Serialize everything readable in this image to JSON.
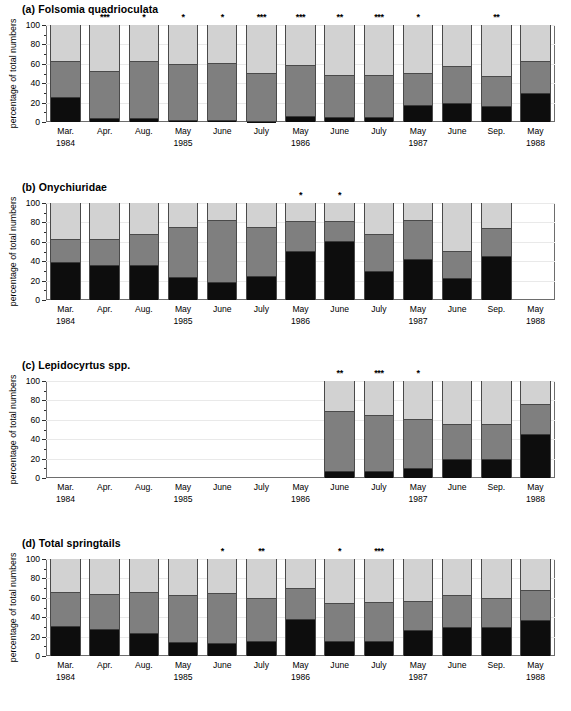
{
  "figure": {
    "yaxis_title": "percentage of total numbers",
    "y_ticks": [
      0,
      20,
      40,
      60,
      80,
      100
    ],
    "y_minor_ticks": [
      10,
      30,
      50,
      70,
      90
    ],
    "ylim": [
      0,
      100
    ],
    "x_categories": [
      {
        "month": "Mar.",
        "year": "1984"
      },
      {
        "month": "Apr.",
        "year": ""
      },
      {
        "month": "Aug.",
        "year": ""
      },
      {
        "month": "May",
        "year": "1985"
      },
      {
        "month": "June",
        "year": ""
      },
      {
        "month": "July",
        "year": ""
      },
      {
        "month": "May",
        "year": "1986"
      },
      {
        "month": "June",
        "year": ""
      },
      {
        "month": "July",
        "year": ""
      },
      {
        "month": "May",
        "year": "1987"
      },
      {
        "month": "June",
        "year": ""
      },
      {
        "month": "Sep.",
        "year": ""
      },
      {
        "month": "May",
        "year": "1988"
      }
    ],
    "colors": {
      "bottom": "#0d0d0d",
      "middle": "#7f7f7f",
      "top": "#d2d2d2",
      "frame": "#6d6d6d",
      "grid": "#e9e9e9"
    }
  },
  "chart_data": [
    {
      "type": "bar",
      "panel": "a",
      "title": "(a) Folsomia quadrioculata",
      "xlabel": "",
      "ylabel": "percentage of total numbers",
      "ylim": [
        0,
        100
      ],
      "grid": true,
      "stacked": true,
      "legend": "none",
      "categories": [
        "Mar. 1984",
        "Apr.",
        "Aug.",
        "May 1985",
        "June",
        "July",
        "May 1986",
        "June",
        "July",
        "May 1987",
        "June",
        "Sep.",
        "May 1988"
      ],
      "series": [
        {
          "name": "bottom",
          "values": [
            25,
            3.5,
            3.5,
            1,
            1,
            0.5,
            5,
            4.5,
            4,
            16,
            19,
            15,
            29
          ]
        },
        {
          "name": "middle",
          "values": [
            37,
            48.5,
            58,
            57.5,
            59,
            49,
            52.5,
            42.5,
            43.5,
            33,
            37.5,
            31.5,
            33
          ]
        },
        {
          "name": "top",
          "values": [
            38,
            48,
            38.5,
            41.5,
            40,
            50.5,
            42.5,
            53,
            52.5,
            51,
            43.5,
            53.5,
            38
          ]
        }
      ],
      "significance": [
        "",
        "***",
        "*",
        "*",
        "*",
        "***",
        "***",
        "**",
        "***",
        "*",
        "",
        "**",
        ""
      ]
    },
    {
      "type": "bar",
      "panel": "b",
      "title": "(b) Onychiuridae",
      "xlabel": "",
      "ylabel": "percentage of total numbers",
      "ylim": [
        0,
        100
      ],
      "grid": true,
      "stacked": true,
      "legend": "none",
      "categories": [
        "Mar. 1984",
        "Apr.",
        "Aug.",
        "May 1985",
        "June",
        "July",
        "May 1986",
        "June",
        "July",
        "May 1987",
        "June",
        "Sep.",
        "May 1988"
      ],
      "series": [
        {
          "name": "bottom",
          "values": [
            38,
            35,
            35,
            22.5,
            17.5,
            24,
            50,
            59.5,
            29,
            41,
            21.5,
            44,
            0
          ]
        },
        {
          "name": "middle",
          "values": [
            24,
            27,
            32.5,
            52,
            64,
            50,
            30.5,
            20.5,
            38.5,
            40.5,
            27.5,
            29.5,
            0
          ]
        },
        {
          "name": "top",
          "values": [
            38,
            38,
            32.5,
            25.5,
            18.5,
            26,
            19.5,
            20,
            32.5,
            18.5,
            51,
            26.5,
            0
          ]
        }
      ],
      "significance": [
        "",
        "",
        "",
        "",
        "",
        "",
        "*",
        "*",
        "",
        "",
        "",
        "",
        ""
      ]
    },
    {
      "type": "bar",
      "panel": "c",
      "title": "(c) Lepidocyrtus spp.",
      "xlabel": "",
      "ylabel": "percentage of total numbers",
      "ylim": [
        0,
        100
      ],
      "grid": true,
      "stacked": true,
      "legend": "none",
      "categories": [
        "Mar. 1984",
        "Apr.",
        "Aug.",
        "May 1985",
        "June",
        "July",
        "May 1986",
        "June",
        "July",
        "May 1987",
        "June",
        "Sep.",
        "May 1988"
      ],
      "series": [
        {
          "name": "bottom",
          "values": [
            0,
            0,
            0,
            0,
            0,
            0,
            0,
            6.5,
            6.5,
            9,
            18.5,
            18.5,
            44
          ]
        },
        {
          "name": "middle",
          "values": [
            0,
            0,
            0,
            0,
            0,
            0,
            0,
            61.5,
            57,
            50.5,
            36,
            36,
            31.5
          ]
        },
        {
          "name": "top",
          "values": [
            0,
            0,
            0,
            0,
            0,
            0,
            0,
            32,
            36.5,
            40.5,
            45.5,
            45.5,
            24.5
          ]
        }
      ],
      "significance": [
        "",
        "",
        "",
        "",
        "",
        "",
        "",
        "**",
        "***",
        "*",
        "",
        "",
        ""
      ]
    },
    {
      "type": "bar",
      "panel": "d",
      "title": "(d) Total springtails",
      "xlabel": "",
      "ylabel": "percentage of total numbers",
      "ylim": [
        0,
        100
      ],
      "grid": true,
      "stacked": true,
      "legend": "none",
      "categories": [
        "Mar. 1984",
        "Apr.",
        "Aug.",
        "May 1985",
        "June",
        "July",
        "May 1986",
        "June",
        "July",
        "May 1987",
        "June",
        "Sep.",
        "May 1988"
      ],
      "series": [
        {
          "name": "bottom",
          "values": [
            30,
            26.5,
            22.5,
            13,
            12.5,
            14.5,
            37,
            14,
            14,
            25.5,
            29,
            29,
            36
          ]
        },
        {
          "name": "middle",
          "values": [
            35,
            36,
            42.5,
            49,
            51.5,
            44,
            32.5,
            40,
            41,
            30,
            33,
            30,
            31
          ]
        },
        {
          "name": "top",
          "values": [
            35,
            37.5,
            35,
            38,
            36,
            41.5,
            30.5,
            46,
            45,
            44.5,
            38,
            41,
            33
          ]
        }
      ],
      "significance": [
        "",
        "",
        "",
        "",
        "*",
        "**",
        "",
        "*",
        "***",
        "",
        "",
        "",
        ""
      ]
    }
  ]
}
